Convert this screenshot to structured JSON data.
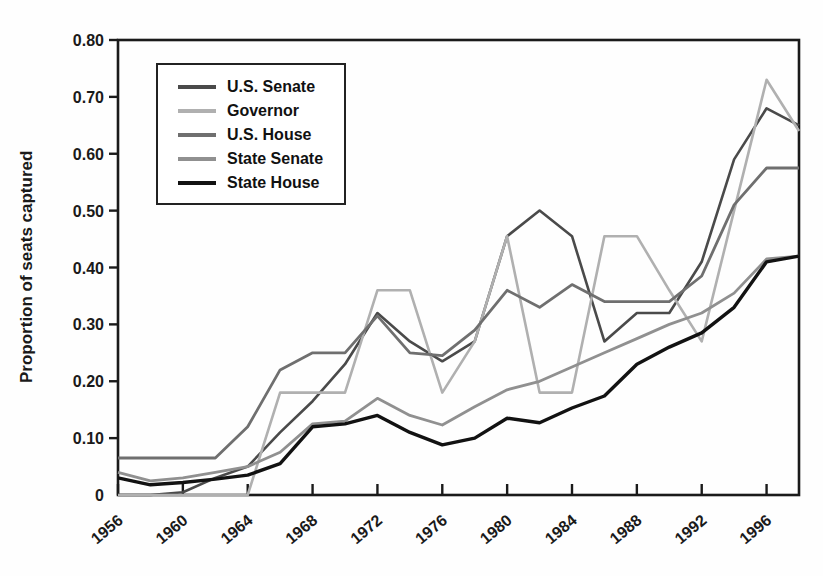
{
  "figure": {
    "background": "#fefefe",
    "axis_color": "#1a1a1a"
  },
  "chart_data": {
    "type": "line",
    "title": "",
    "xlabel": "",
    "ylabel": "Proportion of seats captured",
    "xlim": [
      1956,
      1998
    ],
    "ylim": [
      0,
      0.8
    ],
    "grid": false,
    "legend_position": "upper-left-inside",
    "x_tick_labels": [
      "1956",
      "1960",
      "1964",
      "1968",
      "1972",
      "1976",
      "1980",
      "1984",
      "1988",
      "1992",
      "1996"
    ],
    "x_ticks": [
      1956,
      1960,
      1964,
      1968,
      1972,
      1976,
      1980,
      1984,
      1988,
      1992,
      1996
    ],
    "y_tick_labels": [
      "0",
      "0.10",
      "0.20",
      "0.30",
      "0.40",
      "0.50",
      "0.60",
      "0.70",
      "0.80"
    ],
    "y_ticks": [
      0,
      0.1,
      0.2,
      0.3,
      0.4,
      0.5,
      0.6,
      0.7,
      0.8
    ],
    "x": [
      1956,
      1958,
      1960,
      1962,
      1964,
      1966,
      1968,
      1970,
      1972,
      1974,
      1976,
      1978,
      1980,
      1982,
      1984,
      1986,
      1988,
      1990,
      1992,
      1994,
      1996,
      1998
    ],
    "series": [
      {
        "name": "U.S. Senate",
        "color": "#4a4a4a",
        "line_width": 2.6,
        "values": [
          0,
          0,
          0.005,
          0.03,
          0.05,
          0.11,
          0.165,
          0.23,
          0.32,
          0.27,
          0.235,
          0.27,
          0.455,
          0.5,
          0.455,
          0.27,
          0.32,
          0.32,
          0.41,
          0.59,
          0.68,
          0.65
        ]
      },
      {
        "name": "Governor",
        "color": "#b0b0b0",
        "line_width": 2.6,
        "values": [
          0,
          0,
          0,
          0,
          0,
          0.18,
          0.18,
          0.18,
          0.36,
          0.36,
          0.18,
          0.27,
          0.455,
          0.18,
          0.18,
          0.455,
          0.455,
          0.36,
          0.27,
          0.5,
          0.73,
          0.64
        ]
      },
      {
        "name": "U.S. House",
        "color": "#6f6f6f",
        "line_width": 2.8,
        "values": [
          0.065,
          0.065,
          0.065,
          0.065,
          0.12,
          0.22,
          0.25,
          0.25,
          0.315,
          0.25,
          0.245,
          0.29,
          0.36,
          0.33,
          0.37,
          0.34,
          0.34,
          0.34,
          0.385,
          0.51,
          0.575,
          0.575
        ]
      },
      {
        "name": "State Senate",
        "color": "#909090",
        "line_width": 2.8,
        "values": [
          0.04,
          0.025,
          0.03,
          0.04,
          0.05,
          0.075,
          0.125,
          0.13,
          0.17,
          0.14,
          0.123,
          0.155,
          0.185,
          0.2,
          0.225,
          0.25,
          0.275,
          0.3,
          0.32,
          0.355,
          0.415,
          0.42
        ]
      },
      {
        "name": "State House",
        "color": "#121212",
        "line_width": 3.4,
        "values": [
          0.03,
          0.018,
          0.022,
          0.028,
          0.035,
          0.055,
          0.12,
          0.125,
          0.14,
          0.11,
          0.088,
          0.1,
          0.135,
          0.127,
          0.153,
          0.174,
          0.23,
          0.26,
          0.285,
          0.33,
          0.41,
          0.42
        ]
      }
    ]
  }
}
